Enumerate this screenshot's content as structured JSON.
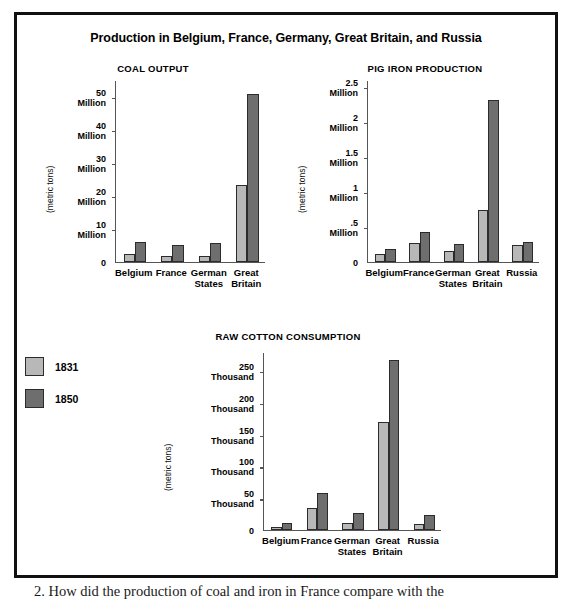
{
  "figure": {
    "title": "Production in Belgium, France, Germany, Great Britain, and Russia",
    "legend": [
      {
        "label": "1831",
        "color": "#b8b8b8"
      },
      {
        "label": "1850",
        "color": "#6e6e6e"
      }
    ]
  },
  "caption": "2. How did the production of coal and iron in France compare with the",
  "chart_data": [
    {
      "type": "bar",
      "title": "COAL OUTPUT",
      "ylabel": "(metric tons)",
      "xlabel": "",
      "unit": "Million",
      "categories": [
        "Belgium",
        "France",
        "German States",
        "Great Britain"
      ],
      "ylim": [
        0,
        55
      ],
      "yticks": [
        0,
        10,
        20,
        30,
        40,
        50
      ],
      "ytick_labels": [
        "0",
        "10 Million",
        "20 Million",
        "30 Million",
        "40 Million",
        "50 Million"
      ],
      "grid": false,
      "legend_position": "external-left",
      "series": [
        {
          "name": "1831",
          "color": "#b8b8b8",
          "values": [
            2.5,
            1.9,
            1.8,
            23.4
          ]
        },
        {
          "name": "1850",
          "color": "#6e6e6e",
          "values": [
            6.0,
            5.0,
            5.7,
            50.8
          ]
        }
      ]
    },
    {
      "type": "bar",
      "title": "PIG IRON PRODUCTION",
      "ylabel": "(metric tons)",
      "xlabel": "",
      "unit": "Million",
      "categories": [
        "Belgium",
        "France",
        "German States",
        "Great Britain",
        "Russia"
      ],
      "ylim": [
        0,
        2.6
      ],
      "yticks": [
        0,
        0.5,
        1,
        1.5,
        2,
        2.5
      ],
      "ytick_labels": [
        "0",
        ".5 Million",
        "1 Million",
        "1.5 Million",
        "2 Million",
        "2.5 Million"
      ],
      "grid": false,
      "legend_position": "external-left",
      "series": [
        {
          "name": "1831",
          "color": "#b8b8b8",
          "values": [
            0.11,
            0.27,
            0.16,
            0.74,
            0.25
          ]
        },
        {
          "name": "1850",
          "color": "#6e6e6e",
          "values": [
            0.18,
            0.43,
            0.26,
            2.31,
            0.28
          ]
        }
      ]
    },
    {
      "type": "bar",
      "title": "RAW COTTON CONSUMPTION",
      "ylabel": "(metric tons)",
      "xlabel": "",
      "unit": "Thousand",
      "categories": [
        "Belgium",
        "France",
        "German States",
        "Great Britain",
        "Russia"
      ],
      "ylim": [
        0,
        280
      ],
      "yticks": [
        0,
        50,
        100,
        150,
        200,
        250
      ],
      "ytick_labels": [
        "0",
        "50 Thousand",
        "100 Thousand",
        "150 Thousand",
        "200 Thousand",
        "250 Thousand"
      ],
      "grid": false,
      "legend_position": "external-left",
      "series": [
        {
          "name": "1831",
          "color": "#b8b8b8",
          "values": [
            4,
            34,
            11,
            170,
            9
          ]
        },
        {
          "name": "1850",
          "color": "#6e6e6e",
          "values": [
            11,
            58,
            27,
            267,
            23
          ]
        }
      ]
    }
  ]
}
